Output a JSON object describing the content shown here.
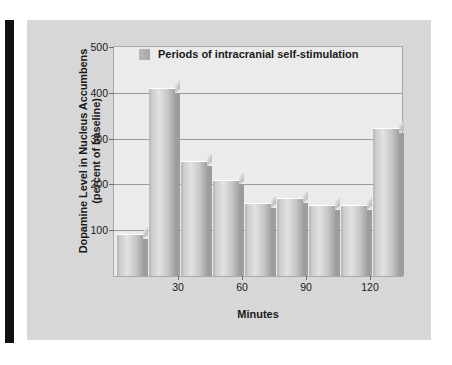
{
  "figure": {
    "panel_color": "#d7d7d7",
    "plot_bg_color": "#ebebeb",
    "bar_color": "#b6b6b6",
    "rule_color": "#111111"
  },
  "legend": {
    "label": "Periods of intracranial self-stimulation",
    "swatch_name": "legend-swatch"
  },
  "axes": {
    "y_title_line1": "Dopamine Level in Nucleus Accumbens",
    "y_title_line2": "(percent of baseline)",
    "x_title": "Minutes"
  },
  "chart_data": {
    "type": "bar",
    "title": "",
    "xlabel": "Minutes",
    "ylabel": "Dopamine Level in Nucleus Accumbens (percent of baseline)",
    "legend": [
      "Periods of intracranial self-stimulation"
    ],
    "legend_position": "top-center-inside",
    "grid": true,
    "ylim": [
      0,
      500
    ],
    "yticks": [
      100,
      200,
      300,
      400,
      500
    ],
    "ytick_labels": [
      "100",
      "200",
      "300",
      "400",
      "500"
    ],
    "xlim": [
      0,
      135
    ],
    "xticks": [
      30,
      60,
      90,
      120
    ],
    "xtick_labels": [
      "30",
      "60",
      "90",
      "120"
    ],
    "x": [
      7.5,
      22.5,
      37.5,
      52.5,
      67.5,
      82.5,
      97.5,
      112.5,
      127.5
    ],
    "categories": [
      "0-15",
      "15-30",
      "30-45",
      "45-60",
      "60-75",
      "75-90",
      "90-105",
      "105-120",
      "120-135"
    ],
    "values": [
      90,
      408,
      250,
      208,
      158,
      168,
      152,
      153,
      322
    ],
    "bar_width_minutes": 12
  }
}
